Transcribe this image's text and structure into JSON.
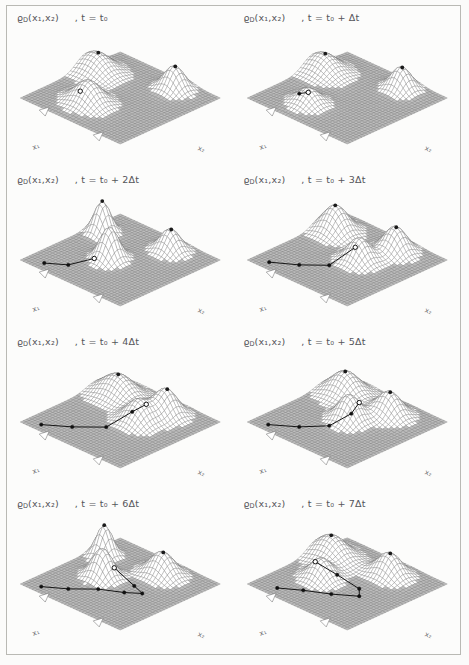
{
  "figure": {
    "rows": 4,
    "cols": 2,
    "background_color": "#fcfcfb",
    "frame_color": "#b9b9b4",
    "surface_color": "#8e8e8e",
    "ink_color": "#55555a",
    "trajectory_color": "#1a1a1a"
  },
  "symbols": {
    "density": "ϱ",
    "density_subscript": "D",
    "open_paren": "(",
    "close_paren": ")",
    "var1": "x",
    "var1_sub": "1",
    "comma": ",",
    "var2": "x",
    "var2_sub": "2",
    "time_var": "t",
    "equals": "=",
    "t0": "t",
    "t0_sub": "0",
    "plus": "+",
    "delta": "Δ",
    "axis_x1": "x",
    "axis_x1_sub": "1",
    "axis_x2": "x",
    "axis_x2_sub": "2"
  },
  "panels": [
    {
      "id": "panel-t0",
      "index": 0,
      "row": 0,
      "col": 0,
      "density_label": "ϱ",
      "density_sub": "D",
      "args": "(x₁,x₂)",
      "time_label": ", t = t₀",
      "time_multiplier": "",
      "axis_x1": "x₁",
      "axis_x2": "x₂",
      "chart_data": {
        "type": "surface",
        "title": "ϱ_D(x₁,x₂) , t = t₀",
        "xlabel": "x₁",
        "ylabel": "x₂",
        "zlabel": "ϱ_D",
        "grid": true,
        "mesh_n": 34,
        "peaks": [
          {
            "cx": 0.1,
            "cy": 0.34,
            "amp": 0.38,
            "sx": 0.13,
            "sy": 0.1
          },
          {
            "cx": 0.68,
            "cy": 0.14,
            "amp": 0.46,
            "sx": 0.08,
            "sy": 0.07
          },
          {
            "cx": 0.4,
            "cy": 0.72,
            "amp": 0.44,
            "sx": 0.11,
            "sy": 0.09
          }
        ],
        "markers": [
          {
            "u": 0.11,
            "v": 0.33,
            "kind": "fixed"
          },
          {
            "u": 0.69,
            "v": 0.14,
            "kind": "fixed"
          }
        ],
        "trajectory": {
          "points": [
            [
              0.4,
              0.8
            ]
          ],
          "head": [
            0.4,
            0.8
          ],
          "path_style": "dot"
        }
      }
    },
    {
      "id": "panel-t1",
      "index": 1,
      "row": 0,
      "col": 1,
      "density_label": "ϱ",
      "density_sub": "D",
      "args": "(x₁,x₂)",
      "time_label": ", t = t₀ + Δt",
      "time_multiplier": "",
      "axis_x1": "x₁",
      "axis_x2": "x₂",
      "chart_data": {
        "type": "surface",
        "title": "ϱ_D(x₁,x₂) , t = t₀ + Δt",
        "xlabel": "x₁",
        "ylabel": "x₂",
        "zlabel": "ϱ_D",
        "grid": true,
        "mesh_n": 34,
        "peaks": [
          {
            "cx": 0.1,
            "cy": 0.34,
            "amp": 0.36,
            "sx": 0.13,
            "sy": 0.1
          },
          {
            "cx": 0.68,
            "cy": 0.14,
            "amp": 0.44,
            "sx": 0.08,
            "sy": 0.07
          },
          {
            "cx": 0.37,
            "cy": 0.76,
            "amp": 0.3,
            "sx": 0.09,
            "sy": 0.08
          }
        ],
        "markers": [
          {
            "u": 0.11,
            "v": 0.33,
            "kind": "fixed"
          },
          {
            "u": 0.69,
            "v": 0.14,
            "kind": "fixed"
          }
        ],
        "trajectory": {
          "points": [
            [
              0.34,
              0.82
            ],
            [
              0.4,
              0.79
            ]
          ],
          "head": [
            0.4,
            0.79
          ],
          "path_style": "short"
        }
      }
    },
    {
      "id": "panel-t2",
      "index": 2,
      "row": 1,
      "col": 0,
      "density_label": "ϱ",
      "density_sub": "D",
      "args": "(x₁,x₂)",
      "time_label": ", t = t₀ + 2Δt",
      "time_multiplier": "2",
      "axis_x1": "x₁",
      "axis_x2": "x₂",
      "chart_data": {
        "type": "surface",
        "title": "ϱ_D(x₁,x₂) , t = t₀ + 2Δt",
        "xlabel": "x₁",
        "ylabel": "x₂",
        "zlabel": "ϱ_D",
        "grid": true,
        "mesh_n": 34,
        "peaks": [
          {
            "cx": 0.12,
            "cy": 0.3,
            "amp": 0.62,
            "sx": 0.06,
            "sy": 0.06
          },
          {
            "cx": 0.66,
            "cy": 0.16,
            "amp": 0.44,
            "sx": 0.08,
            "sy": 0.07
          },
          {
            "cx": 0.44,
            "cy": 0.55,
            "amp": 0.62,
            "sx": 0.07,
            "sy": 0.07
          }
        ],
        "markers": [
          {
            "u": 0.12,
            "v": 0.3,
            "kind": "fixed"
          },
          {
            "u": 0.67,
            "v": 0.16,
            "kind": "fixed"
          }
        ],
        "trajectory": {
          "points": [
            [
              0.16,
              0.92
            ],
            [
              0.3,
              0.82
            ],
            [
              0.42,
              0.68
            ]
          ],
          "head": [
            0.42,
            0.68
          ],
          "path_style": "line"
        }
      }
    },
    {
      "id": "panel-t3",
      "index": 3,
      "row": 1,
      "col": 1,
      "density_label": "ϱ",
      "density_sub": "D",
      "args": "(x₁,x₂)",
      "time_label": ", t = t₀ + 3Δt",
      "time_multiplier": "3",
      "axis_x1": "x₁",
      "axis_x2": "x₂",
      "chart_data": {
        "type": "surface",
        "title": "ϱ_D(x₁,x₂) , t = t₀ + 3Δt",
        "xlabel": "x₁",
        "ylabel": "x₂",
        "zlabel": "ϱ_D",
        "grid": true,
        "mesh_n": 34,
        "peaks": [
          {
            "cx": 0.14,
            "cy": 0.26,
            "amp": 0.52,
            "sx": 0.1,
            "sy": 0.09
          },
          {
            "cx": 0.66,
            "cy": 0.18,
            "amp": 0.5,
            "sx": 0.09,
            "sy": 0.08
          },
          {
            "cx": 0.58,
            "cy": 0.46,
            "amp": 0.46,
            "sx": 0.09,
            "sy": 0.08
          }
        ],
        "markers": [
          {
            "u": 0.14,
            "v": 0.26,
            "kind": "fixed"
          },
          {
            "u": 0.67,
            "v": 0.18,
            "kind": "fixed"
          }
        ],
        "trajectory": {
          "points": [
            [
              0.14,
              0.92
            ],
            [
              0.32,
              0.8
            ],
            [
              0.48,
              0.66
            ],
            [
              0.6,
              0.52
            ]
          ],
          "head": [
            0.6,
            0.52
          ],
          "path_style": "line"
        }
      }
    },
    {
      "id": "panel-t4",
      "index": 4,
      "row": 2,
      "col": 0,
      "density_label": "ϱ",
      "density_sub": "D",
      "args": "(x₁,x₂)",
      "time_label": ", t = t₀ + 4Δt",
      "time_multiplier": "4",
      "axis_x1": "x₁",
      "axis_x2": "x₂",
      "chart_data": {
        "type": "surface",
        "title": "ϱ_D(x₁,x₂) , t = t₀ + 4Δt",
        "xlabel": "x₁",
        "ylabel": "x₂",
        "zlabel": "ϱ_D",
        "grid": true,
        "mesh_n": 34,
        "peaks": [
          {
            "cx": 0.22,
            "cy": 0.24,
            "amp": 0.44,
            "sx": 0.14,
            "sy": 0.1
          },
          {
            "cx": 0.66,
            "cy": 0.2,
            "amp": 0.5,
            "sx": 0.09,
            "sy": 0.08
          },
          {
            "cx": 0.6,
            "cy": 0.42,
            "amp": 0.44,
            "sx": 0.1,
            "sy": 0.09
          }
        ],
        "markers": [
          {
            "u": 0.22,
            "v": 0.24,
            "kind": "fixed"
          },
          {
            "u": 0.67,
            "v": 0.2,
            "kind": "fixed"
          }
        ],
        "trajectory": {
          "points": [
            [
              0.14,
              0.93
            ],
            [
              0.32,
              0.8
            ],
            [
              0.5,
              0.64
            ],
            [
              0.62,
              0.5
            ],
            [
              0.66,
              0.4
            ]
          ],
          "head": [
            0.66,
            0.4
          ],
          "path_style": "curve"
        }
      }
    },
    {
      "id": "panel-t5",
      "index": 5,
      "row": 2,
      "col": 1,
      "density_label": "ϱ",
      "density_sub": "D",
      "args": "(x₁,x₂)",
      "time_label": ", t = t₀ + 5Δt",
      "time_multiplier": "5",
      "axis_x1": "x₁",
      "axis_x2": "x₂",
      "chart_data": {
        "type": "surface",
        "title": "ϱ_D(x₁,x₂) , t = t₀ + 5Δt",
        "xlabel": "x₁",
        "ylabel": "x₂",
        "zlabel": "ϱ_D",
        "grid": true,
        "mesh_n": 34,
        "peaks": [
          {
            "cx": 0.2,
            "cy": 0.22,
            "amp": 0.46,
            "sx": 0.12,
            "sy": 0.1
          },
          {
            "cx": 0.64,
            "cy": 0.22,
            "amp": 0.46,
            "sx": 0.1,
            "sy": 0.08
          },
          {
            "cx": 0.5,
            "cy": 0.48,
            "amp": 0.5,
            "sx": 0.09,
            "sy": 0.08
          }
        ],
        "markers": [
          {
            "u": 0.2,
            "v": 0.22,
            "kind": "fixed"
          },
          {
            "u": 0.65,
            "v": 0.22,
            "kind": "fixed"
          }
        ],
        "trajectory": {
          "points": [
            [
              0.14,
              0.93
            ],
            [
              0.32,
              0.8
            ],
            [
              0.48,
              0.66
            ],
            [
              0.58,
              0.54
            ],
            [
              0.56,
              0.44
            ]
          ],
          "head": [
            0.56,
            0.44
          ],
          "path_style": "curve"
        }
      }
    },
    {
      "id": "panel-t6",
      "index": 6,
      "row": 3,
      "col": 0,
      "density_label": "ϱ",
      "density_sub": "D",
      "args": "(x₁,x₂)",
      "time_label": ", t = t₀ + 6Δt",
      "time_multiplier": "6",
      "axis_x1": "x₁",
      "axis_x2": "x₂",
      "chart_data": {
        "type": "surface",
        "title": "ϱ_D(x₁,x₂) , t = t₀ + 6Δt",
        "xlabel": "x₁",
        "ylabel": "x₂",
        "zlabel": "ϱ_D",
        "grid": true,
        "mesh_n": 34,
        "peaks": [
          {
            "cx": 0.12,
            "cy": 0.28,
            "amp": 0.6,
            "sx": 0.06,
            "sy": 0.06
          },
          {
            "cx": 0.62,
            "cy": 0.2,
            "amp": 0.46,
            "sx": 0.1,
            "sy": 0.08
          },
          {
            "cx": 0.34,
            "cy": 0.52,
            "amp": 0.56,
            "sx": 0.08,
            "sy": 0.07
          }
        ],
        "markers": [
          {
            "u": 0.12,
            "v": 0.28,
            "kind": "fixed"
          },
          {
            "u": 0.63,
            "v": 0.2,
            "kind": "fixed"
          }
        ],
        "trajectory": {
          "points": [
            [
              0.14,
              0.93
            ],
            [
              0.3,
              0.82
            ],
            [
              0.46,
              0.68
            ],
            [
              0.62,
              0.58
            ],
            [
              0.72,
              0.5
            ],
            [
              0.6,
              0.46
            ],
            [
              0.44,
              0.5
            ]
          ],
          "head": [
            0.44,
            0.5
          ],
          "path_style": "loop"
        }
      }
    },
    {
      "id": "panel-t7",
      "index": 7,
      "row": 3,
      "col": 1,
      "density_label": "ϱ",
      "density_sub": "D",
      "args": "(x₁,x₂)",
      "time_label": ", t = t₀ + 7Δt",
      "time_multiplier": "7",
      "axis_x1": "x₁",
      "axis_x2": "x₂",
      "chart_data": {
        "type": "surface",
        "title": "ϱ_D(x₁,x₂) , t = t₀ + 7Δt",
        "xlabel": "x₁",
        "ylabel": "x₂",
        "zlabel": "ϱ_D",
        "grid": true,
        "mesh_n": 34,
        "peaks": [
          {
            "cx": 0.14,
            "cy": 0.3,
            "amp": 0.44,
            "sx": 0.13,
            "sy": 0.1
          },
          {
            "cx": 0.62,
            "cy": 0.2,
            "amp": 0.44,
            "sx": 0.1,
            "sy": 0.08
          },
          {
            "cx": 0.32,
            "cy": 0.58,
            "amp": 0.4,
            "sx": 0.09,
            "sy": 0.08
          }
        ],
        "markers": [
          {
            "u": 0.14,
            "v": 0.3,
            "kind": "fixed"
          },
          {
            "u": 0.63,
            "v": 0.2,
            "kind": "fixed"
          }
        ],
        "trajectory": {
          "points": [
            [
              0.2,
              0.9
            ],
            [
              0.36,
              0.8
            ],
            [
              0.54,
              0.7
            ],
            [
              0.7,
              0.58
            ],
            [
              0.62,
              0.5
            ],
            [
              0.44,
              0.54
            ],
            [
              0.3,
              0.62
            ]
          ],
          "head": [
            0.3,
            0.62
          ],
          "path_style": "loop"
        }
      }
    }
  ]
}
